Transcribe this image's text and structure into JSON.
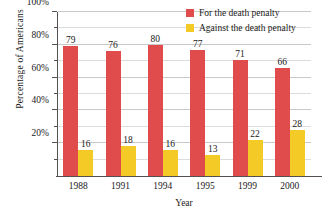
{
  "chart_data": {
    "type": "bar",
    "title": "",
    "xlabel": "Year",
    "ylabel": "Percentage of Americans",
    "categories": [
      "1988",
      "1991",
      "1994",
      "1995",
      "1999",
      "2000"
    ],
    "series": [
      {
        "name": "For the death penalty",
        "color": "#e04b4b",
        "values": [
          79,
          76,
          80,
          77,
          71,
          66
        ]
      },
      {
        "name": "Against the death penalty",
        "color": "#f3ca26",
        "values": [
          16,
          18,
          16,
          13,
          22,
          28
        ]
      }
    ],
    "ylim": [
      0,
      100
    ],
    "ytick_labels": [
      "100%",
      "80%",
      "60%",
      "40%",
      "20%"
    ],
    "ytick_values": [
      100,
      80,
      60,
      40,
      20
    ],
    "yminor_values": [
      90,
      70,
      50,
      30,
      10
    ],
    "grid": true,
    "legend_position": "top-right",
    "value_labels": true
  },
  "legend": {
    "items": [
      {
        "label": "For the death penalty",
        "color": "#e04b4b"
      },
      {
        "label": "Against the death penalty",
        "color": "#f3ca26"
      }
    ]
  },
  "colors": {
    "for_death_penalty": "#e04b4b",
    "against_death_penalty": "#f3ca26",
    "axis": "#55504e",
    "gridline": "#dcdcdc",
    "background": "#ffffff",
    "text": "#1a1a1a"
  }
}
